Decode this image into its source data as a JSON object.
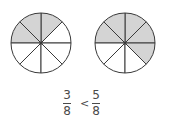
{
  "diagram": {
    "colors": {
      "shaded": "#d4d4d4",
      "line": "#3a3a3a",
      "unshaded": "#ffffff"
    },
    "circles": [
      {
        "name": "left-circle",
        "cx": 41,
        "cy": 43,
        "r": 30,
        "slices": 8,
        "shaded": [
          4,
          5,
          6
        ],
        "fraction": "3/8"
      },
      {
        "name": "right-circle",
        "cx": 125,
        "cy": 43,
        "r": 30,
        "slices": 8,
        "shaded": [
          1,
          2,
          3,
          4,
          5
        ],
        "fraction": "5/8"
      }
    ],
    "comparison": {
      "left": {
        "numerator": "3",
        "denominator": "8"
      },
      "operator": "<",
      "right": {
        "numerator": "5",
        "denominator": "8"
      }
    }
  }
}
